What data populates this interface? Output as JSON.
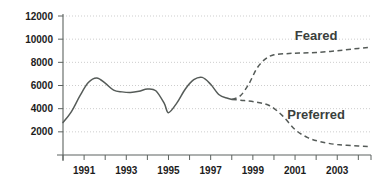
{
  "chart_data": {
    "type": "line",
    "title": "",
    "xlabel": "",
    "ylabel": "",
    "xlim": [
      1990,
      2004.6
    ],
    "ylim": [
      0,
      12000
    ],
    "grid": true,
    "legend_position": "inline-annotation",
    "y_ticks": [
      2000,
      4000,
      6000,
      8000,
      10000,
      12000
    ],
    "y_tick_labels": [
      "2000",
      "4000",
      "6000",
      "8000",
      "10000",
      "12000"
    ],
    "x_ticks": [
      1990,
      1991,
      1992,
      1993,
      1994,
      1995,
      1996,
      1997,
      1998,
      1999,
      2000,
      2001,
      2002,
      2003,
      2004
    ],
    "x_tick_labels": [
      "",
      "1991",
      "",
      "1993",
      "",
      "1995",
      "",
      "1997",
      "",
      "1999",
      "",
      "2001",
      "",
      "2003",
      ""
    ],
    "annotations": [
      {
        "text": "Feared",
        "x": 2002.0,
        "y": 9900
      },
      {
        "text": "Preferred",
        "x": 2002.0,
        "y": 3150
      }
    ],
    "series": [
      {
        "name": "Historical",
        "style": "solid",
        "x": [
          1990.0,
          1990.4,
          1990.8,
          1991.2,
          1991.6,
          1992.0,
          1992.4,
          1992.8,
          1993.2,
          1993.6,
          1994.0,
          1994.4,
          1994.8,
          1995.0,
          1995.4,
          1995.8,
          1996.2,
          1996.6,
          1997.0,
          1997.4,
          1997.8,
          1998.0
        ],
        "values": [
          2800,
          3750,
          5100,
          6250,
          6650,
          6200,
          5600,
          5450,
          5400,
          5500,
          5700,
          5550,
          4450,
          3650,
          4500,
          5700,
          6500,
          6700,
          6100,
          5200,
          4900,
          4800
        ]
      },
      {
        "name": "Feared",
        "style": "dashed",
        "x": [
          1998.0,
          1998.4,
          1998.8,
          1999.2,
          1999.6,
          2000.0,
          2000.6,
          2001.2,
          2002.0,
          2003.0,
          2004.0,
          2004.6
        ],
        "values": [
          4800,
          5100,
          6100,
          7500,
          8300,
          8650,
          8750,
          8800,
          8850,
          9000,
          9200,
          9300
        ]
      },
      {
        "name": "Preferred",
        "style": "dashed",
        "x": [
          1998.0,
          1998.6,
          1999.2,
          1999.8,
          2000.4,
          2001.0,
          2001.6,
          2002.2,
          2003.0,
          2004.0,
          2004.6
        ],
        "values": [
          4800,
          4700,
          4550,
          4250,
          3400,
          2200,
          1500,
          1150,
          900,
          780,
          730
        ]
      }
    ]
  }
}
